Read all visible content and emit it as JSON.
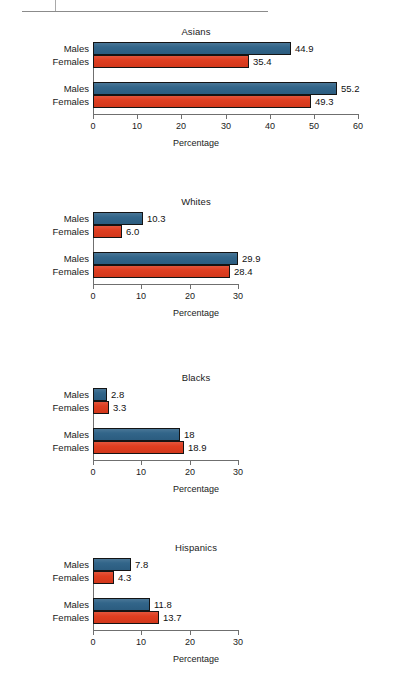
{
  "header": {
    "ghost_text": ""
  },
  "chart_data": [
    {
      "type": "bar",
      "orientation": "horizontal",
      "title": "Asians",
      "xlabel": "Percentage",
      "ylabel": "",
      "xlim": [
        0,
        60
      ],
      "xticks": [
        0,
        10,
        20,
        30,
        40,
        50,
        60
      ],
      "xtick_labels": [
        "0",
        "10",
        "20",
        "30",
        "40",
        "50",
        "60"
      ],
      "grid": false,
      "legend": "none",
      "groups": [
        {
          "year": "1990",
          "bars": [
            {
              "series": "Males",
              "label": "Males",
              "value": 44.9,
              "value_label": "44.9",
              "color": "#2e6287"
            },
            {
              "series": "Females",
              "label": "Females",
              "value": 35.4,
              "value_label": "35.4",
              "color": "#de3a1c"
            }
          ]
        },
        {
          "year": "2007",
          "bars": [
            {
              "series": "Males",
              "label": "Males",
              "value": 55.2,
              "value_label": "55.2",
              "color": "#2e6287"
            },
            {
              "series": "Females",
              "label": "Females",
              "value": 49.3,
              "value_label": "49.3",
              "color": "#de3a1c"
            }
          ]
        }
      ]
    },
    {
      "type": "bar",
      "orientation": "horizontal",
      "title": "Whites",
      "xlabel": "Percentage",
      "ylabel": "",
      "xlim": [
        0,
        30
      ],
      "xticks": [
        0,
        10,
        20,
        30
      ],
      "xtick_labels": [
        "0",
        "10",
        "20",
        "30"
      ],
      "grid": false,
      "legend": "none",
      "groups": [
        {
          "year": "1960",
          "bars": [
            {
              "series": "Males",
              "label": "Males",
              "value": 10.3,
              "value_label": "10.3",
              "color": "#2e6287"
            },
            {
              "series": "Females",
              "label": "Females",
              "value": 6.0,
              "value_label": "6.0",
              "color": "#de3a1c"
            }
          ]
        },
        {
          "year": "2007",
          "bars": [
            {
              "series": "Males",
              "label": "Males",
              "value": 29.9,
              "value_label": "29.9",
              "color": "#2e6287"
            },
            {
              "series": "Females",
              "label": "Females",
              "value": 28.4,
              "value_label": "28.4",
              "color": "#de3a1c"
            }
          ]
        }
      ]
    },
    {
      "type": "bar",
      "orientation": "horizontal",
      "title": "Blacks",
      "xlabel": "Percentage",
      "ylabel": "",
      "xlim": [
        0,
        30
      ],
      "xticks": [
        0,
        10,
        20,
        30
      ],
      "xtick_labels": [
        "0",
        "10",
        "20",
        "30"
      ],
      "grid": false,
      "legend": "none",
      "groups": [
        {
          "year": "1960",
          "bars": [
            {
              "series": "Males",
              "label": "Males",
              "value": 2.8,
              "value_label": "2.8",
              "color": "#2e6287"
            },
            {
              "series": "Females",
              "label": "Females",
              "value": 3.3,
              "value_label": "3.3",
              "color": "#de3a1c"
            }
          ]
        },
        {
          "year": "2007",
          "bars": [
            {
              "series": "Males",
              "label": "Males",
              "value": 18.0,
              "value_label": "18",
              "color": "#2e6287"
            },
            {
              "series": "Females",
              "label": "Females",
              "value": 18.9,
              "value_label": "18.9",
              "color": "#de3a1c"
            }
          ]
        }
      ]
    },
    {
      "type": "bar",
      "orientation": "horizontal",
      "title": "Hispanics",
      "xlabel": "Percentage",
      "ylabel": "",
      "xlim": [
        0,
        30
      ],
      "xticks": [
        0,
        10,
        20,
        30
      ],
      "xtick_labels": [
        "0",
        "10",
        "20",
        "30"
      ],
      "grid": false,
      "legend": "none",
      "groups": [
        {
          "year": "1970",
          "bars": [
            {
              "series": "Males",
              "label": "Males",
              "value": 7.8,
              "value_label": "7.8",
              "color": "#2e6287"
            },
            {
              "series": "Females",
              "label": "Females",
              "value": 4.3,
              "value_label": "4.3",
              "color": "#de3a1c"
            }
          ]
        },
        {
          "year": "2007",
          "bars": [
            {
              "series": "Males",
              "label": "Males",
              "value": 11.8,
              "value_label": "11.8",
              "color": "#2e6287"
            },
            {
              "series": "Females",
              "label": "Females",
              "value": 13.7,
              "value_label": "13.7",
              "color": "#de3a1c"
            }
          ]
        }
      ]
    }
  ]
}
